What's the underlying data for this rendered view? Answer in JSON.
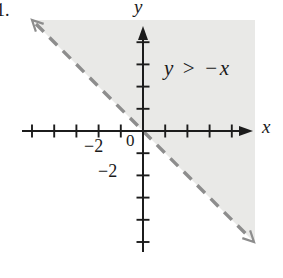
{
  "figure": {
    "item_number": "1.",
    "inequality_label": "y > −x",
    "x_axis_label": "x",
    "y_axis_label": "y",
    "origin_label": "0",
    "x_axis_tick_label": "−2",
    "y_axis_tick_label": "−2"
  },
  "colors": {
    "background": "#ffffff",
    "axis": "#1c1c1c",
    "boundary_line": "#8d8d8d",
    "shaded_region": "#e9e9e7",
    "text": "#1a1a1a"
  },
  "chart_data": {
    "type": "line",
    "inequality": "y > −x",
    "xlabel": "x",
    "ylabel": "y",
    "xlim": [
      -5.5,
      4.7
    ],
    "ylim": [
      -5.5,
      4.7
    ],
    "grid": false,
    "x_ticks": [
      -5,
      -4,
      -3,
      -2,
      -1,
      1,
      2,
      3,
      4
    ],
    "y_ticks": [
      -5,
      -4,
      -3,
      -2,
      -1,
      1,
      2,
      3,
      4
    ],
    "labeled_x_ticks": [
      -2
    ],
    "labeled_y_ticks": [
      -2
    ],
    "boundary_line": {
      "equation": "y = −x",
      "slope": -1,
      "y_intercept": 0,
      "style": "dashed",
      "arrowheads": "both ends",
      "points": [
        [
          -5,
          5
        ],
        [
          5,
          -5
        ]
      ]
    },
    "shaded_region": {
      "side": "above boundary line",
      "condition": "y > −x",
      "strict": true
    }
  }
}
